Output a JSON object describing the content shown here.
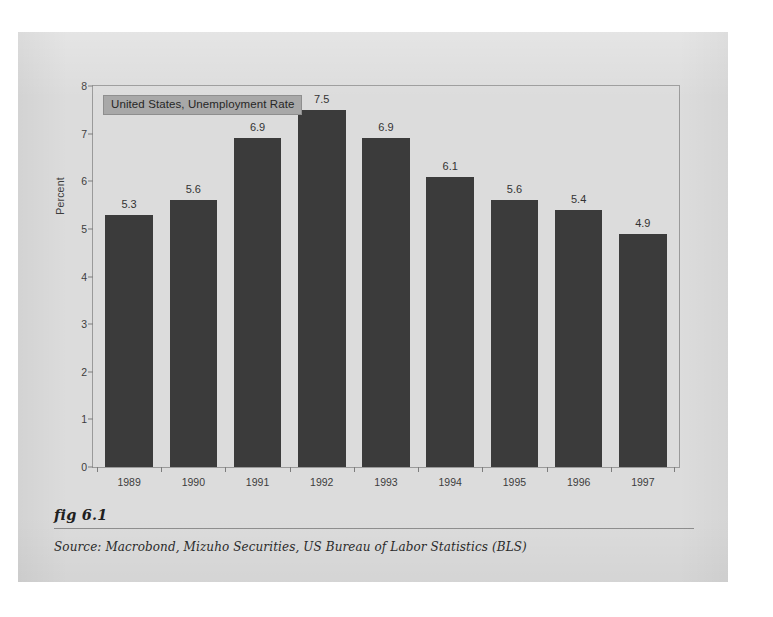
{
  "figure": {
    "fig_label": "fig 6.1",
    "source": "Source:  Macrobond, Mizuho Securities, US Bureau of Labor Statistics (BLS)"
  },
  "colors": {
    "bar": "#3b3b3b",
    "panel": "#dcdcdc",
    "legend_background": "#a8a8a8",
    "frame": "#9a9a9a",
    "text": "#3c3c3c"
  },
  "chart_data": {
    "type": "bar",
    "title": "United States, Unemployment Rate",
    "xlabel": "",
    "ylabel": "Percent",
    "categories": [
      "1989",
      "1990",
      "1991",
      "1992",
      "1993",
      "1994",
      "1995",
      "1996",
      "1997"
    ],
    "values": [
      5.3,
      5.6,
      6.9,
      7.5,
      6.9,
      6.1,
      5.6,
      5.4,
      4.9
    ],
    "value_labels": [
      "5.3",
      "5.6",
      "6.9",
      "7.5",
      "6.9",
      "6.1",
      "5.6",
      "5.4",
      "4.9"
    ],
    "ylim": [
      0,
      8
    ],
    "yticks": [
      0,
      1,
      2,
      3,
      4,
      5,
      6,
      7,
      8
    ],
    "ytick_labels": [
      "0",
      "1",
      "2",
      "3",
      "4",
      "5",
      "6",
      "7",
      "8"
    ],
    "grid": false,
    "legend_position": "top-left",
    "legend_entries": [
      "United States, Unemployment Rate"
    ]
  }
}
